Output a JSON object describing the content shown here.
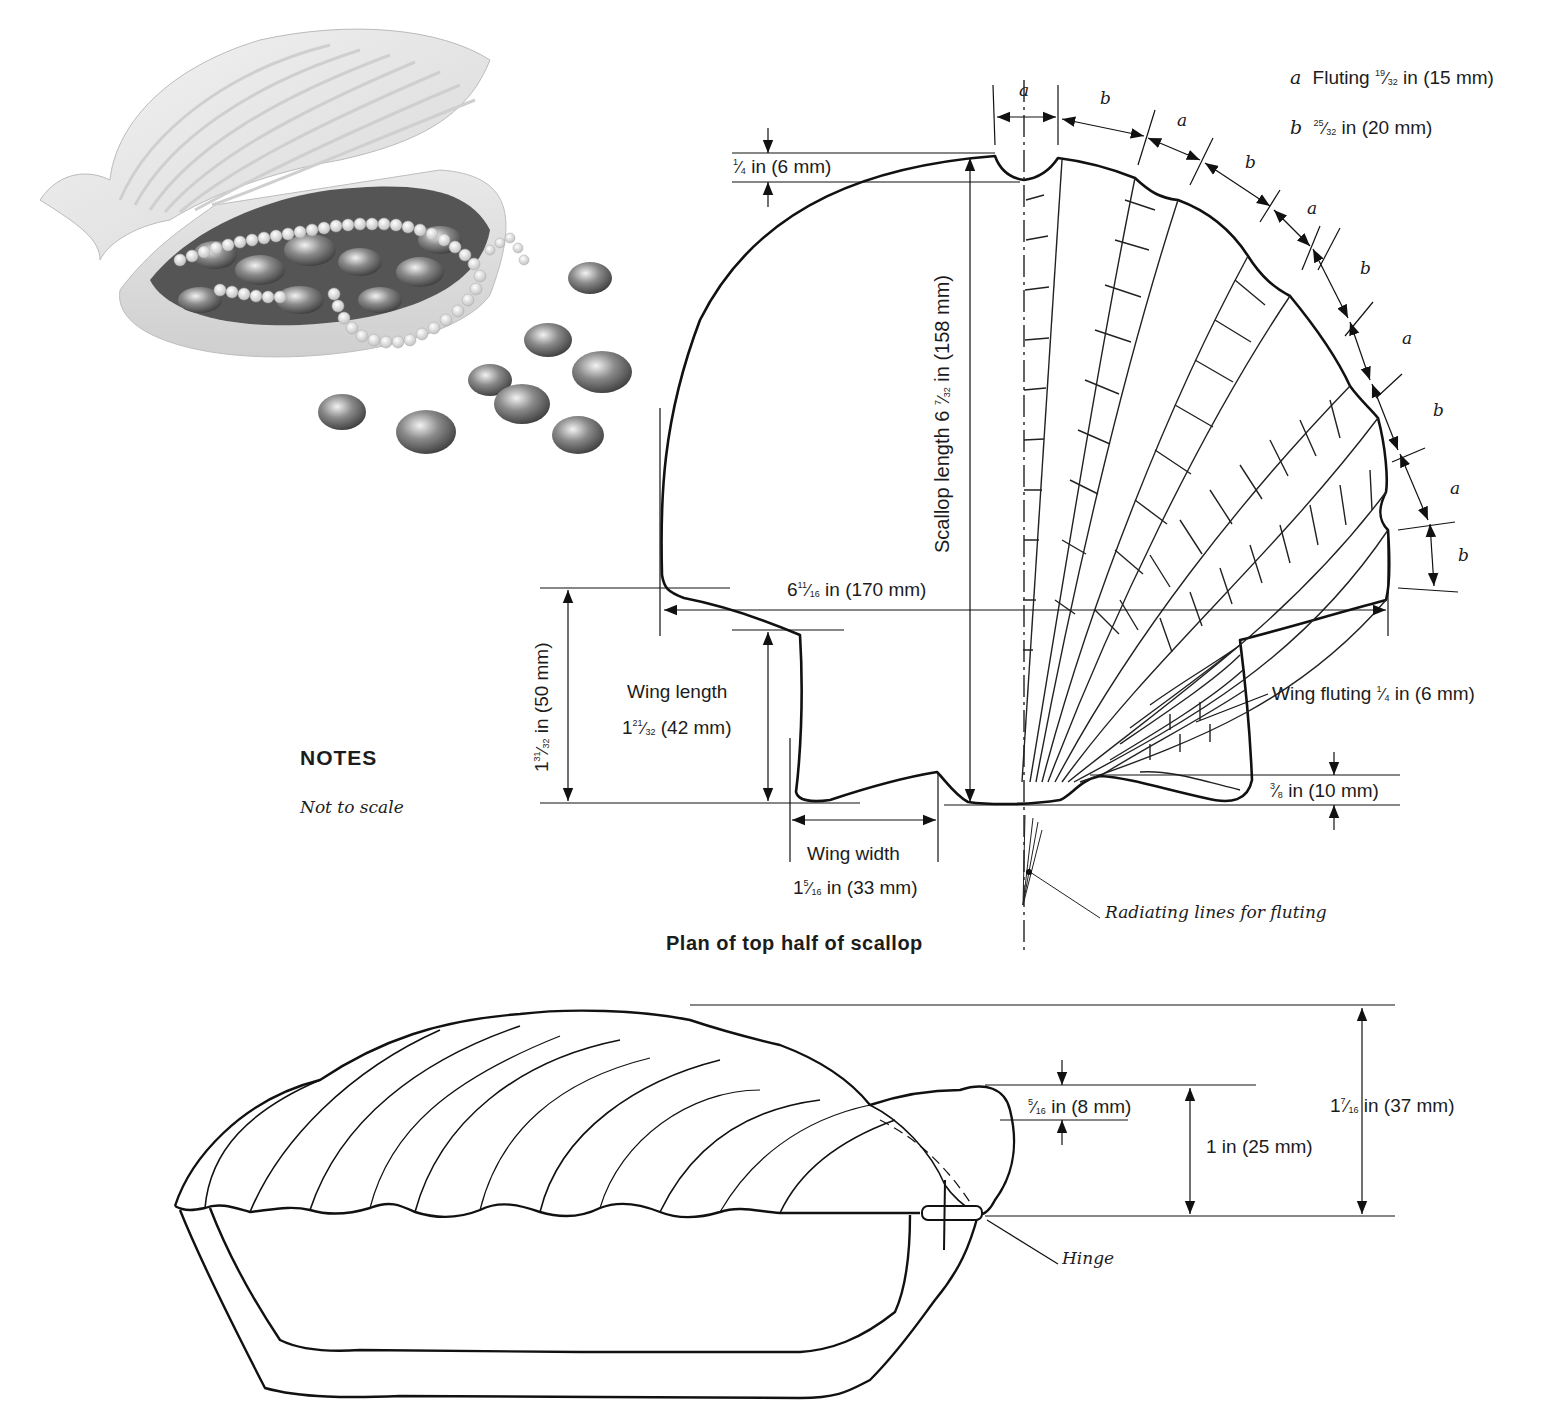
{
  "photo": {
    "description": "Finished scallop shell box with lid open, filled with pearls and glass beads",
    "icon": "scallop-photo"
  },
  "legend": {
    "a_letter": "a",
    "a_label": "Fluting",
    "a_frac_num": "19",
    "a_frac_den": "32",
    "a_rest": "in (15 mm)",
    "b_letter": "b",
    "b_frac_num": "25",
    "b_frac_den": "32",
    "b_rest": "in (20 mm)"
  },
  "fluting_sequence": [
    "a",
    "b",
    "a",
    "b",
    "a",
    "b",
    "a",
    "b",
    "a",
    "b"
  ],
  "plan": {
    "title": "Plan of top half of scallop",
    "top_notch": {
      "num": "1",
      "den": "4",
      "rest": "in (6 mm)"
    },
    "scallop_length": {
      "prefix": "Scallop length 6",
      "num": "7",
      "den": "32",
      "rest": "in (158 mm)"
    },
    "width": {
      "whole": "6",
      "num": "11",
      "den": "16",
      "rest": "in (170 mm)"
    },
    "left_height": {
      "whole": "1",
      "num": "31",
      "den": "32",
      "rest": "in (50 mm)"
    },
    "wing_length": {
      "label": "Wing length",
      "whole": "1",
      "num": "21",
      "den": "32",
      "rest": "(42 mm)"
    },
    "wing_width": {
      "label": "Wing width",
      "whole": "1",
      "num": "5",
      "den": "16",
      "rest": "in (33 mm)"
    },
    "wing_fluting": {
      "label": "Wing fluting",
      "num": "1",
      "den": "4",
      "rest": "in (6 mm)"
    },
    "base_gap": {
      "num": "3",
      "den": "8",
      "rest": "in (10 mm)"
    },
    "radiating_lines": "Radiating lines for fluting"
  },
  "notes": {
    "title": "NOTES",
    "text": "Not to scale"
  },
  "side_view": {
    "hinge_offset": {
      "num": "5",
      "den": "16",
      "rest": "in (8 mm)"
    },
    "hinge_height": {
      "label": "1 in (25 mm)"
    },
    "total_height": {
      "whole": "1",
      "num": "7",
      "den": "16",
      "rest": "in (37 mm)"
    },
    "hinge_label": "Hinge"
  },
  "colors": {
    "line": "#1a1a1a",
    "background": "#ffffff"
  }
}
